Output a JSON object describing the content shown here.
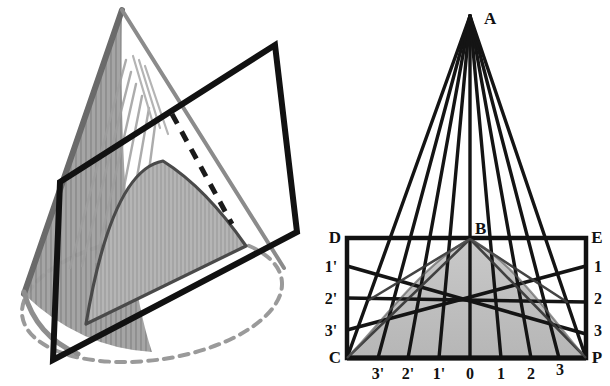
{
  "figure": {
    "title_visible": false,
    "panel_count": 2,
    "background_color": "#ffffff",
    "ink_color": "#111111",
    "shade_fill": "#b8b8b8",
    "cone_shade_fill": "#9a9a9a",
    "dashed_color": "#8f8f8f"
  },
  "left_panel": {
    "name": "pictorial-cone-with-cutting-plane",
    "cone": {
      "apex": {
        "x": 122,
        "y": 10
      },
      "base_ellipse": {
        "cx": 152,
        "cy": 300,
        "rx": 132,
        "ry": 62,
        "rotation": -8
      },
      "left_generator_end": {
        "x": 22,
        "y": 292
      },
      "right_generator_end": {
        "x": 282,
        "y": 308
      },
      "hatch_line_count": 9,
      "base_curve_style": "dashed"
    },
    "cutting_plane": {
      "shape": "parallelogram",
      "corners": [
        {
          "label": "top-left",
          "x": 60,
          "y": 182
        },
        {
          "label": "top-right",
          "x": 275,
          "y": 45
        },
        {
          "label": "bottom-right",
          "x": 297,
          "y": 232
        },
        {
          "label": "bottom-left",
          "x": 53,
          "y": 360
        }
      ],
      "stroke_width": 5
    },
    "section_curve": {
      "type": "parabola",
      "label": "shaded parabolic section",
      "fill": "#b0b0b0",
      "vertex": {
        "x": 163,
        "y": 163
      },
      "left_end": {
        "x": 86,
        "y": 322
      },
      "right_end": {
        "x": 243,
        "y": 244
      }
    },
    "hidden_edge": {
      "style": "dashed",
      "from": {
        "x": 172,
        "y": 116
      },
      "to": {
        "x": 227,
        "y": 218
      }
    }
  },
  "right_panel": {
    "name": "orthographic-construction-of-parabola",
    "apex": {
      "id": "A",
      "x": 165,
      "y": 14
    },
    "rect": {
      "left": 42,
      "top": 238,
      "right": 281,
      "bottom": 358,
      "stroke_width": 4
    },
    "points": [
      {
        "id": "A",
        "label": "A",
        "x": 165,
        "y": 14,
        "anchor": "apex"
      },
      {
        "id": "B",
        "label": "B",
        "x": 165,
        "y": 238,
        "anchor": "top-mid"
      },
      {
        "id": "C",
        "label": "C",
        "x": 42,
        "y": 358,
        "anchor": "bottom-left"
      },
      {
        "id": "D",
        "label": "D",
        "x": 42,
        "y": 238,
        "anchor": "top-left"
      },
      {
        "id": "E",
        "label": "E",
        "x": 281,
        "y": 238,
        "anchor": "top-right"
      },
      {
        "id": "P",
        "label": "P",
        "x": 281,
        "y": 358,
        "anchor": "bottom-right"
      }
    ],
    "corner_labels": [
      {
        "label": "A",
        "x": 179,
        "y": 22
      },
      {
        "label": "B",
        "x": 170,
        "y": 233
      },
      {
        "label": "D",
        "x": 26,
        "y": 240
      },
      {
        "label": "E",
        "x": 289,
        "y": 240
      },
      {
        "label": "C",
        "x": 26,
        "y": 361
      },
      {
        "label": "P",
        "x": 289,
        "y": 361
      }
    ],
    "left_side_labels": [
      {
        "label": "1'",
        "x": 23,
        "y": 270,
        "tick_y": 266
      },
      {
        "label": "2'",
        "x": 23,
        "y": 302,
        "tick_y": 298
      },
      {
        "label": "3'",
        "x": 23,
        "y": 334,
        "tick_y": 330
      }
    ],
    "right_side_labels": [
      {
        "label": "1",
        "x": 291,
        "y": 270,
        "tick_y": 266
      },
      {
        "label": "2",
        "x": 291,
        "y": 302,
        "tick_y": 298
      },
      {
        "label": "3",
        "x": 291,
        "y": 334,
        "tick_y": 330
      }
    ],
    "bottom_labels": [
      {
        "label": "3'",
        "x": 73,
        "y": 376,
        "tick_x": 73
      },
      {
        "label": "2'",
        "x": 103,
        "y": 376,
        "tick_x": 103
      },
      {
        "label": "1'",
        "x": 134,
        "y": 376,
        "tick_x": 134
      },
      {
        "label": "0",
        "x": 165,
        "y": 376,
        "tick_x": 165
      },
      {
        "label": "1",
        "x": 196,
        "y": 376,
        "tick_x": 196
      },
      {
        "label": "2",
        "x": 226,
        "y": 376,
        "tick_x": 226
      },
      {
        "label": "3",
        "x": 254,
        "y": 373,
        "tick_x": 254
      }
    ],
    "generator_lines_from_apex": [
      {
        "to_x": 42,
        "to_y": 358
      },
      {
        "to_x": 73,
        "to_y": 358
      },
      {
        "to_x": 103,
        "to_y": 358
      },
      {
        "to_x": 134,
        "to_y": 358
      },
      {
        "to_x": 165,
        "to_y": 358
      },
      {
        "to_x": 196,
        "to_y": 358
      },
      {
        "to_x": 226,
        "to_y": 358
      },
      {
        "to_x": 254,
        "to_y": 358
      },
      {
        "to_x": 281,
        "to_y": 358
      }
    ],
    "projector_lines": [
      {
        "from_x": 42,
        "from_y": 266,
        "to_x": 281,
        "to_y": 334
      },
      {
        "from_x": 42,
        "from_y": 298,
        "to_x": 281,
        "to_y": 302
      },
      {
        "from_x": 42,
        "from_y": 330,
        "to_x": 281,
        "to_y": 266
      }
    ],
    "parabola": {
      "vertex": {
        "x": 165,
        "y": 238
      },
      "left_end": {
        "x": 42,
        "y": 358
      },
      "right_end": {
        "x": 281,
        "y": 358
      },
      "fill": "#bdbdbd"
    }
  }
}
